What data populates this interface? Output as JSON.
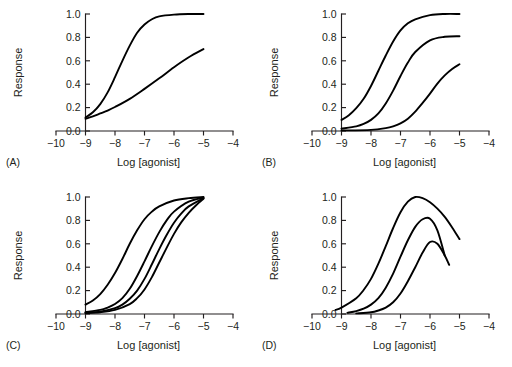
{
  "figure": {
    "background": "#ffffff",
    "curve_color": "#000000",
    "axis_color": "#231f20",
    "panel_count": 4
  },
  "axes": {
    "xlabel": "Log [agonist]",
    "ylabel": "Response",
    "xlim": [
      -10,
      -4
    ],
    "ylim": [
      0.0,
      1.0
    ],
    "xticks": [
      -10,
      -9,
      -8,
      -7,
      -6,
      -5,
      -4
    ],
    "xticklabels": [
      "−10",
      "−9",
      "−8",
      "−7",
      "−6",
      "−5",
      "−4"
    ],
    "yticks": [
      0.0,
      0.2,
      0.4,
      0.6,
      0.8,
      1.0
    ],
    "yticklabels": [
      "0.0",
      "0.2",
      "0.4",
      "0.6",
      "0.8",
      "1.0"
    ],
    "grid": false,
    "legend": "none"
  },
  "panels": [
    {
      "id": "A",
      "label": "(A)"
    },
    {
      "id": "B",
      "label": "(B)"
    },
    {
      "id": "C",
      "label": "(C)"
    },
    {
      "id": "D",
      "label": "(D)"
    }
  ],
  "chart_data": [
    {
      "type": "line",
      "panel": "A",
      "title": "(A)",
      "xlabel": "Log [agonist]",
      "ylabel": "Response",
      "xlim": [
        -10,
        -4
      ],
      "ylim": [
        0.0,
        1.0
      ],
      "grid": false,
      "legend": "none",
      "series": [
        {
          "name": "full agonist steep curve",
          "x": [
            -9.0,
            -8.75,
            -8.5,
            -8.25,
            -8.0,
            -7.75,
            -7.5,
            -7.25,
            -7.0,
            -6.75,
            -6.5,
            -6.0,
            -5.5,
            -5.0
          ],
          "values": [
            0.115,
            0.16,
            0.23,
            0.33,
            0.46,
            0.6,
            0.73,
            0.84,
            0.91,
            0.955,
            0.98,
            0.995,
            1.0,
            1.0
          ]
        },
        {
          "name": "shallow low-slope curve",
          "x": [
            -9.0,
            -8.75,
            -8.5,
            -8.25,
            -8.0,
            -7.5,
            -7.0,
            -6.5,
            -6.0,
            -5.5,
            -5.0
          ],
          "values": [
            0.105,
            0.125,
            0.15,
            0.175,
            0.205,
            0.275,
            0.36,
            0.45,
            0.545,
            0.63,
            0.7
          ]
        }
      ]
    },
    {
      "type": "line",
      "panel": "B",
      "title": "(B)",
      "xlabel": "Log [agonist]",
      "ylabel": "Response",
      "xlim": [
        -10,
        -4
      ],
      "ylim": [
        0.0,
        1.0
      ],
      "grid": false,
      "legend": "none",
      "series": [
        {
          "name": "control curve max 1.0",
          "x": [
            -9.0,
            -8.75,
            -8.5,
            -8.25,
            -8.0,
            -7.75,
            -7.5,
            -7.25,
            -7.0,
            -6.75,
            -6.5,
            -6.0,
            -5.5,
            -5.0
          ],
          "values": [
            0.095,
            0.135,
            0.195,
            0.275,
            0.385,
            0.515,
            0.645,
            0.765,
            0.86,
            0.92,
            0.955,
            0.99,
            1.0,
            1.0
          ]
        },
        {
          "name": "depressed maximum 0.81",
          "x": [
            -9.0,
            -8.5,
            -8.25,
            -8.0,
            -7.75,
            -7.5,
            -7.25,
            -7.0,
            -6.75,
            -6.5,
            -6.0,
            -5.5,
            -5.0
          ],
          "values": [
            0.02,
            0.04,
            0.06,
            0.095,
            0.15,
            0.235,
            0.345,
            0.47,
            0.585,
            0.675,
            0.775,
            0.805,
            0.81
          ]
        },
        {
          "name": "depressed maximum 0.57",
          "x": [
            -9.0,
            -8.0,
            -7.5,
            -7.25,
            -7.0,
            -6.75,
            -6.5,
            -6.25,
            -6.0,
            -5.75,
            -5.5,
            -5.25,
            -5.0
          ],
          "values": [
            0.005,
            0.01,
            0.025,
            0.04,
            0.065,
            0.105,
            0.165,
            0.24,
            0.32,
            0.405,
            0.475,
            0.53,
            0.57
          ]
        }
      ]
    },
    {
      "type": "line",
      "panel": "C",
      "title": "(C)",
      "xlabel": "Log [agonist]",
      "ylabel": "Response",
      "xlim": [
        -10,
        -4
      ],
      "ylim": [
        0.0,
        1.0
      ],
      "grid": false,
      "legend": "none",
      "series": [
        {
          "name": "control curve",
          "x": [
            -9.0,
            -8.75,
            -8.5,
            -8.25,
            -8.0,
            -7.75,
            -7.5,
            -7.25,
            -7.0,
            -6.75,
            -6.5,
            -6.0,
            -5.5,
            -5.0
          ],
          "values": [
            0.08,
            0.115,
            0.17,
            0.25,
            0.35,
            0.47,
            0.6,
            0.715,
            0.81,
            0.875,
            0.92,
            0.97,
            0.99,
            1.0
          ]
        },
        {
          "name": "shifted right x3",
          "x": [
            -9.0,
            -8.5,
            -8.25,
            -8.0,
            -7.75,
            -7.5,
            -7.25,
            -7.0,
            -6.75,
            -6.5,
            -6.25,
            -6.0,
            -5.5,
            -5.0
          ],
          "values": [
            0.015,
            0.035,
            0.055,
            0.085,
            0.135,
            0.215,
            0.325,
            0.45,
            0.58,
            0.7,
            0.8,
            0.875,
            0.96,
            0.995
          ]
        },
        {
          "name": "shifted right x10",
          "x": [
            -9.0,
            -8.5,
            -8.0,
            -7.75,
            -7.5,
            -7.25,
            -7.0,
            -6.75,
            -6.5,
            -6.25,
            -6.0,
            -5.75,
            -5.5,
            -5.0
          ],
          "values": [
            0.01,
            0.02,
            0.05,
            0.08,
            0.13,
            0.2,
            0.3,
            0.425,
            0.555,
            0.675,
            0.78,
            0.86,
            0.92,
            0.99
          ]
        },
        {
          "name": "shifted right x30",
          "x": [
            -9.0,
            -8.5,
            -8.0,
            -7.5,
            -7.25,
            -7.0,
            -6.75,
            -6.5,
            -6.25,
            -6.0,
            -5.75,
            -5.5,
            -5.25,
            -5.0
          ],
          "values": [
            0.008,
            0.015,
            0.035,
            0.085,
            0.135,
            0.21,
            0.315,
            0.44,
            0.565,
            0.685,
            0.785,
            0.865,
            0.93,
            0.985
          ]
        }
      ]
    },
    {
      "type": "line",
      "panel": "D",
      "title": "(D)",
      "xlabel": "Log [agonist]",
      "ylabel": "Response",
      "xlim": [
        -10,
        -4
      ],
      "ylim": [
        0.0,
        1.0
      ],
      "grid": false,
      "legend": "none",
      "series": [
        {
          "name": "bell-shaped peak 1.0",
          "x": [
            -9.2,
            -9.0,
            -8.5,
            -8.25,
            -8.0,
            -7.75,
            -7.5,
            -7.25,
            -7.0,
            -6.75,
            -6.5,
            -6.25,
            -6.0,
            -5.75,
            -5.5,
            -5.25,
            -5.0
          ],
          "values": [
            0.035,
            0.055,
            0.135,
            0.205,
            0.3,
            0.43,
            0.58,
            0.735,
            0.87,
            0.96,
            1.0,
            0.99,
            0.955,
            0.9,
            0.83,
            0.74,
            0.64
          ]
        },
        {
          "name": "bell-shaped peak 0.82",
          "x": [
            -8.8,
            -8.5,
            -8.25,
            -8.0,
            -7.75,
            -7.5,
            -7.25,
            -7.0,
            -6.75,
            -6.5,
            -6.25,
            -6.0,
            -5.75,
            -5.5
          ],
          "values": [
            0.01,
            0.025,
            0.045,
            0.08,
            0.135,
            0.225,
            0.345,
            0.49,
            0.63,
            0.745,
            0.81,
            0.815,
            0.715,
            0.5
          ]
        },
        {
          "name": "bell-shaped peak 0.62",
          "x": [
            -8.5,
            -8.0,
            -7.75,
            -7.5,
            -7.25,
            -7.0,
            -6.75,
            -6.5,
            -6.25,
            -6.0,
            -5.75,
            -5.5,
            -5.35
          ],
          "values": [
            0.005,
            0.015,
            0.03,
            0.055,
            0.1,
            0.175,
            0.28,
            0.4,
            0.525,
            0.615,
            0.6,
            0.5,
            0.42
          ]
        }
      ]
    }
  ]
}
